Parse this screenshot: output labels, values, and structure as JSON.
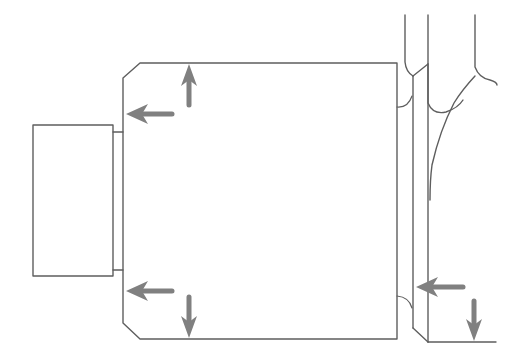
{
  "diagram": {
    "colors": {
      "line": "#5e5e5e",
      "arrow": "#808080",
      "background": "#ffffff"
    },
    "parts": [
      {
        "id": "left-block",
        "label": ""
      },
      {
        "id": "connector",
        "label": ""
      },
      {
        "id": "main-block",
        "label": ""
      },
      {
        "id": "thin-plate",
        "label": ""
      },
      {
        "id": "tube-left",
        "label": ""
      },
      {
        "id": "tube-right",
        "label": ""
      }
    ],
    "arrows": [
      {
        "id": "arrow-top-up",
        "direction": "up"
      },
      {
        "id": "arrow-top-left",
        "direction": "left"
      },
      {
        "id": "arrow-bottom-left",
        "direction": "left"
      },
      {
        "id": "arrow-bottom-down",
        "direction": "down"
      },
      {
        "id": "arrow-right-left",
        "direction": "left"
      },
      {
        "id": "arrow-right-down",
        "direction": "down"
      }
    ]
  }
}
